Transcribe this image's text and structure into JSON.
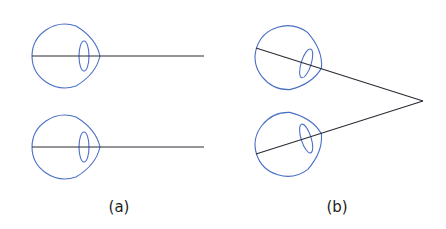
{
  "figure": {
    "panels": [
      {
        "id": "a",
        "label": "(a)",
        "description": "Parallel gaze: both eyes looking straight ahead along parallel lines"
      },
      {
        "id": "b",
        "label": "(b)",
        "description": "Convergent gaze: both eyes rotated toward a near point where lines of sight meet"
      }
    ],
    "colors": {
      "eye_outline": "#4a6fc7",
      "sight_line": "#2a2a35",
      "label_text": "#222222"
    }
  }
}
